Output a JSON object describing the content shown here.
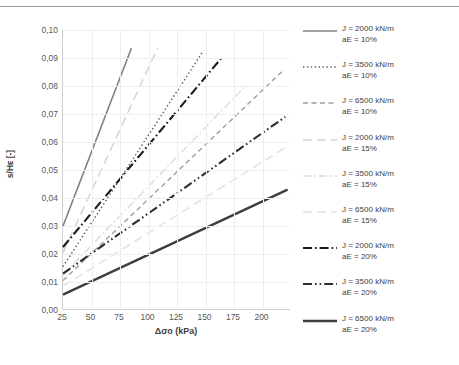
{
  "chart_data": {
    "type": "line",
    "title": "",
    "xlabel": "Δσo (kPa)",
    "ylabel": "s/Hᴇ [-]",
    "xlim": [
      25,
      225
    ],
    "ylim": [
      0.0,
      0.1
    ],
    "xticks": [
      25,
      50,
      75,
      100,
      125,
      150,
      175,
      200
    ],
    "yticks": [
      "0,00",
      "0,01",
      "0,02",
      "0,03",
      "0,04",
      "0,05",
      "0,06",
      "0,07",
      "0,08",
      "0,09",
      "0,10"
    ],
    "ytick_values": [
      0.0,
      0.01,
      0.02,
      0.03,
      0.04,
      0.05,
      0.06,
      0.07,
      0.08,
      0.09,
      0.1
    ],
    "grid": true,
    "legend_position": "right",
    "decimal_separator": ",",
    "series": [
      {
        "name": "J = 2000 kN/m aE = 10%",
        "label_line1": "J = 2000 kN/m",
        "label_line2": "aE = 10%",
        "J": 2000,
        "aE": "10%",
        "style": "solid",
        "color": "#808080",
        "width": 1.6,
        "x": [
          25,
          85
        ],
        "y": [
          0.03,
          0.0935
        ]
      },
      {
        "name": "J = 3500 kN/m aE = 10%",
        "label_line1": "J = 3500 kN/m",
        "label_line2": "aE = 10%",
        "J": 3500,
        "aE": "10%",
        "style": "dotted",
        "color": "#595959",
        "width": 1.5,
        "x": [
          25,
          148
        ],
        "y": [
          0.0155,
          0.0925
        ]
      },
      {
        "name": "J = 6500 kN/m aE = 10%",
        "label_line1": "J = 6500 kN/m",
        "label_line2": "aE = 10%",
        "J": 6500,
        "aE": "10%",
        "style": "dashed",
        "color": "#9e9e9e",
        "width": 1.4,
        "x": [
          25,
          218
        ],
        "y": [
          0.0105,
          0.0855
        ]
      },
      {
        "name": "J = 2000 kN/m aE = 15%",
        "label_line1": "J = 2000 kN/m",
        "label_line2": "aE = 15%",
        "J": 2000,
        "aE": "15%",
        "style": "long-dash",
        "color": "#d4d4d4",
        "width": 1.5,
        "x": [
          25,
          108
        ],
        "y": [
          0.0205,
          0.0935
        ]
      },
      {
        "name": "J = 3500 kN/m aE = 15%",
        "label_line1": "J = 3500 kN/m",
        "label_line2": "aE = 15%",
        "J": 3500,
        "aE": "15%",
        "style": "dash-dot-light",
        "color": "#dcdcdc",
        "width": 1.5,
        "x": [
          25,
          185
        ],
        "y": [
          0.0125,
          0.08
        ]
      },
      {
        "name": "J = 6500 kN/m aE = 15%",
        "label_line1": "J = 6500 kN/m",
        "label_line2": "aE = 15%",
        "J": 6500,
        "aE": "15%",
        "style": "long-dash-light",
        "color": "#e2e2e2",
        "width": 1.5,
        "x": [
          25,
          222
        ],
        "y": [
          0.0085,
          0.0585
        ]
      },
      {
        "name": "J = 2000 kN/m aE = 20%",
        "label_line1": "J = 2000 kN/m",
        "label_line2": "aE = 20%",
        "J": 2000,
        "aE": "20%",
        "style": "dash-dot",
        "color": "#1a1a1a",
        "width": 2.1,
        "x": [
          25,
          165
        ],
        "y": [
          0.0225,
          0.0905
        ]
      },
      {
        "name": "J = 3500 kN/m aE = 20%",
        "label_line1": "J = 3500 kN/m",
        "label_line2": "aE = 20%",
        "J": 3500,
        "aE": "20%",
        "style": "dash-dot-dot",
        "color": "#2e2e2e",
        "width": 2.1,
        "x": [
          25,
          220
        ],
        "y": [
          0.013,
          0.069
        ]
      },
      {
        "name": "J = 6500 kN/m aE = 20%",
        "label_line1": "J = 6500 kN/m",
        "label_line2": "aE = 20%",
        "J": 6500,
        "aE": "20%",
        "style": "solid-thick",
        "color": "#3d3d3d",
        "width": 2.3,
        "x": [
          25,
          222
        ],
        "y": [
          0.0055,
          0.043
        ]
      }
    ]
  }
}
